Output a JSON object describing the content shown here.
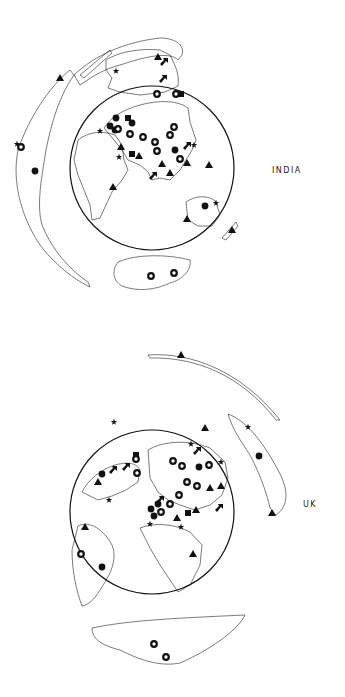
{
  "figure": {
    "panels": [
      {
        "id": "india",
        "label": "INDIA",
        "globe": {
          "cx": 152,
          "cy": 168,
          "r": 82
        },
        "markers": [
          {
            "type": "triangle",
            "x": 60,
            "y": 78
          },
          {
            "type": "star",
            "x": 116,
            "y": 71
          },
          {
            "type": "triangle",
            "x": 158,
            "y": 57
          },
          {
            "type": "arrow",
            "x": 164,
            "y": 62
          },
          {
            "type": "arrow",
            "x": 163,
            "y": 79
          },
          {
            "type": "ring",
            "x": 157,
            "y": 94
          },
          {
            "type": "ring",
            "x": 176,
            "y": 94
          },
          {
            "type": "square",
            "x": 181,
            "y": 94
          },
          {
            "type": "ring",
            "x": 21,
            "y": 147
          },
          {
            "type": "star",
            "x": 17,
            "y": 144
          },
          {
            "type": "circle",
            "x": 35,
            "y": 171
          },
          {
            "type": "circle",
            "x": 116,
            "y": 118
          },
          {
            "type": "circle",
            "x": 110,
            "y": 126
          },
          {
            "type": "square",
            "x": 128,
            "y": 118
          },
          {
            "type": "circle",
            "x": 132,
            "y": 123
          },
          {
            "type": "circle",
            "x": 115,
            "y": 130
          },
          {
            "type": "ring",
            "x": 118,
            "y": 129
          },
          {
            "type": "star",
            "x": 100,
            "y": 131
          },
          {
            "type": "ring",
            "x": 130,
            "y": 134
          },
          {
            "type": "ring",
            "x": 143,
            "y": 137
          },
          {
            "type": "ring",
            "x": 174,
            "y": 127
          },
          {
            "type": "ring",
            "x": 170,
            "y": 135
          },
          {
            "type": "ring",
            "x": 155,
            "y": 142
          },
          {
            "type": "ring",
            "x": 157,
            "y": 151
          },
          {
            "type": "triangle",
            "x": 121,
            "y": 147
          },
          {
            "type": "square",
            "x": 132,
            "y": 154
          },
          {
            "type": "triangle",
            "x": 139,
            "y": 156
          },
          {
            "type": "star",
            "x": 119,
            "y": 157
          },
          {
            "type": "circle",
            "x": 175,
            "y": 150
          },
          {
            "type": "arrow",
            "x": 187,
            "y": 146
          },
          {
            "type": "star",
            "x": 194,
            "y": 145
          },
          {
            "type": "ring",
            "x": 180,
            "y": 159
          },
          {
            "type": "triangle",
            "x": 187,
            "y": 163
          },
          {
            "type": "triangle",
            "x": 162,
            "y": 164
          },
          {
            "type": "triangle",
            "x": 170,
            "y": 173
          },
          {
            "type": "triangle",
            "x": 209,
            "y": 165
          },
          {
            "type": "arrow",
            "x": 153,
            "y": 176
          },
          {
            "type": "triangle",
            "x": 113,
            "y": 187
          },
          {
            "type": "circle",
            "x": 205,
            "y": 206
          },
          {
            "type": "star",
            "x": 216,
            "y": 203
          },
          {
            "type": "triangle",
            "x": 187,
            "y": 219
          },
          {
            "type": "triangle",
            "x": 232,
            "y": 230
          },
          {
            "type": "ring",
            "x": 151,
            "y": 276
          },
          {
            "type": "ring",
            "x": 174,
            "y": 273
          }
        ]
      },
      {
        "id": "uk",
        "label": "UK",
        "globe": {
          "cx": 152,
          "cy": 512,
          "r": 82
        },
        "markers": [
          {
            "type": "triangle",
            "x": 181,
            "y": 355
          },
          {
            "type": "star",
            "x": 114,
            "y": 422
          },
          {
            "type": "triangle",
            "x": 205,
            "y": 428
          },
          {
            "type": "star",
            "x": 248,
            "y": 427
          },
          {
            "type": "star",
            "x": 191,
            "y": 444
          },
          {
            "type": "arrow",
            "x": 197,
            "y": 451
          },
          {
            "type": "square",
            "x": 136,
            "y": 455
          },
          {
            "type": "ring",
            "x": 136,
            "y": 459
          },
          {
            "type": "ring",
            "x": 173,
            "y": 461
          },
          {
            "type": "ring",
            "x": 182,
            "y": 466
          },
          {
            "type": "circle",
            "x": 199,
            "y": 467
          },
          {
            "type": "ring",
            "x": 209,
            "y": 465
          },
          {
            "type": "star",
            "x": 221,
            "y": 462
          },
          {
            "type": "circle",
            "x": 259,
            "y": 456
          },
          {
            "type": "circle",
            "x": 102,
            "y": 474
          },
          {
            "type": "arrow",
            "x": 113,
            "y": 470
          },
          {
            "type": "arrow",
            "x": 126,
            "y": 467
          },
          {
            "type": "ring",
            "x": 137,
            "y": 473
          },
          {
            "type": "triangle",
            "x": 98,
            "y": 482
          },
          {
            "type": "ring",
            "x": 187,
            "y": 482
          },
          {
            "type": "ring",
            "x": 197,
            "y": 486
          },
          {
            "type": "triangle",
            "x": 210,
            "y": 488
          },
          {
            "type": "triangle",
            "x": 221,
            "y": 486
          },
          {
            "type": "star",
            "x": 109,
            "y": 500
          },
          {
            "type": "ring",
            "x": 179,
            "y": 495
          },
          {
            "type": "arrow",
            "x": 160,
            "y": 500
          },
          {
            "type": "circle",
            "x": 158,
            "y": 504
          },
          {
            "type": "ring",
            "x": 170,
            "y": 504
          },
          {
            "type": "circle",
            "x": 151,
            "y": 509
          },
          {
            "type": "ring",
            "x": 161,
            "y": 512
          },
          {
            "type": "circle",
            "x": 154,
            "y": 516
          },
          {
            "type": "square",
            "x": 188,
            "y": 513
          },
          {
            "type": "triangle",
            "x": 196,
            "y": 510
          },
          {
            "type": "arrow",
            "x": 219,
            "y": 508
          },
          {
            "type": "triangle",
            "x": 177,
            "y": 518
          },
          {
            "type": "star",
            "x": 150,
            "y": 524
          },
          {
            "type": "star",
            "x": 181,
            "y": 527
          },
          {
            "type": "triangle",
            "x": 272,
            "y": 513
          },
          {
            "type": "triangle",
            "x": 85,
            "y": 527
          },
          {
            "type": "ring",
            "x": 81,
            "y": 554
          },
          {
            "type": "circle",
            "x": 102,
            "y": 567
          },
          {
            "type": "triangle",
            "x": 193,
            "y": 554
          },
          {
            "type": "ring",
            "x": 154,
            "y": 644
          },
          {
            "type": "ring",
            "x": 166,
            "y": 657
          }
        ]
      }
    ]
  }
}
